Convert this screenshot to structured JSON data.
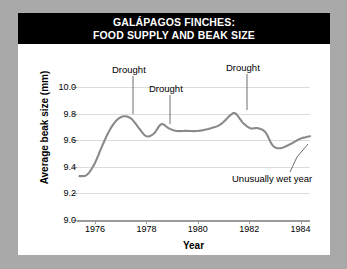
{
  "title": {
    "line1": "GALÁPAGOS FINCHES:",
    "line2": "FOOD SUPPLY AND BEAK SIZE"
  },
  "colors": {
    "background": "#a9a9a9",
    "panel": "#ffffff",
    "title_bar": "#000000",
    "title_text": "#ffffff",
    "curve": "#8a8a8a",
    "grid": "#dcdcdc",
    "axis": "#9a9a9a"
  },
  "chart_data": {
    "type": "line",
    "title": "GALÁPAGOS FINCHES: FOOD SUPPLY AND BEAK SIZE",
    "xlabel": "Year",
    "ylabel": "Average beak size (mm)",
    "xlim": [
      1975.6,
      1985.0
    ],
    "ylim": [
      9.0,
      10.0
    ],
    "xticks": [
      1976,
      1978,
      1980,
      1982,
      1984
    ],
    "xticklabels": [
      "1976",
      "1978",
      "1980",
      "1982",
      "1984"
    ],
    "yticks": [
      9.0,
      9.2,
      9.4,
      9.6,
      9.8,
      10.0
    ],
    "yticklabels": [
      "9.0",
      "9.2",
      "9.4",
      "9.6",
      "9.8",
      "10.0"
    ],
    "grid": true,
    "legend": null,
    "series": [
      {
        "name": "Average beak size",
        "x": [
          1975.7,
          1976.0,
          1976.3,
          1976.6,
          1976.9,
          1977.2,
          1977.5,
          1977.8,
          1978.1,
          1978.4,
          1978.7,
          1979.0,
          1979.3,
          1979.6,
          1980.0,
          1980.5,
          1981.0,
          1981.4,
          1981.8,
          1982.0,
          1982.3,
          1982.6,
          1982.9,
          1983.2,
          1983.5,
          1983.8,
          1984.2,
          1984.6,
          1985.0
        ],
        "y": [
          9.33,
          9.34,
          9.42,
          9.55,
          9.67,
          9.75,
          9.78,
          9.76,
          9.69,
          9.63,
          9.65,
          9.72,
          9.69,
          9.67,
          9.67,
          9.67,
          9.69,
          9.72,
          9.79,
          9.8,
          9.73,
          9.69,
          9.69,
          9.66,
          9.56,
          9.54,
          9.57,
          9.61,
          9.63
        ]
      }
    ],
    "annotations": [
      {
        "label": "Drought",
        "target_x": 1977.5,
        "target_y": 9.78
      },
      {
        "label": "Drought",
        "target_x": 1979.0,
        "target_y": 9.72
      },
      {
        "label": "Drought",
        "target_x": 1981.9,
        "target_y": 9.8
      },
      {
        "label": "Unusually wet year",
        "target_x": 1983.7,
        "target_y": 9.545
      }
    ]
  },
  "annotations": {
    "drought_1": "Drought",
    "drought_2": "Drought",
    "drought_3": "Drought",
    "wet_year": "Unusually wet year"
  }
}
